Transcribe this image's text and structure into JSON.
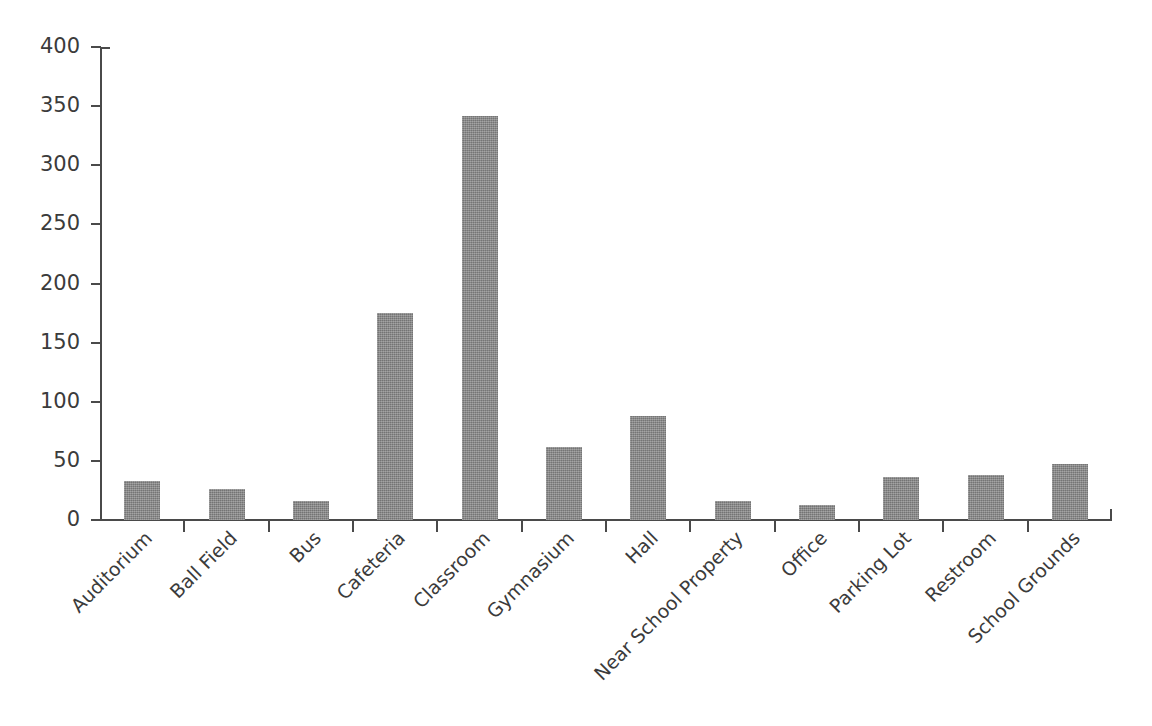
{
  "chart_data": {
    "type": "bar",
    "title": "",
    "subtitle": "",
    "xlabel": "",
    "ylabel": "",
    "ylim": [
      0,
      400
    ],
    "yticks": [
      0,
      50,
      100,
      150,
      200,
      250,
      300,
      350,
      400
    ],
    "ytick_labels": [
      "0",
      "50",
      "100",
      "150",
      "200",
      "250",
      "300",
      "350",
      "400"
    ],
    "grid": false,
    "legend": null,
    "legend_position": "none",
    "bar_color": "#828282",
    "axis_color": "#4a4a4a",
    "text_color": "#3b3b3b",
    "background": "#ffffff",
    "xtick_label_rotation": -45,
    "categories": [
      "Auditorium",
      "Ball Field",
      "Bus",
      "Cafeteria",
      "Classroom",
      "Gymnasium",
      "Hall",
      "Near School Property",
      "Office",
      "Parking Lot",
      "Restroom",
      "School Grounds"
    ],
    "values": [
      33,
      26,
      16,
      175,
      342,
      62,
      88,
      16,
      13,
      36,
      38,
      47
    ],
    "series": [
      {
        "name": "Incidents",
        "values": [
          33,
          26,
          16,
          175,
          342,
          62,
          88,
          16,
          13,
          36,
          38,
          47
        ]
      }
    ]
  }
}
